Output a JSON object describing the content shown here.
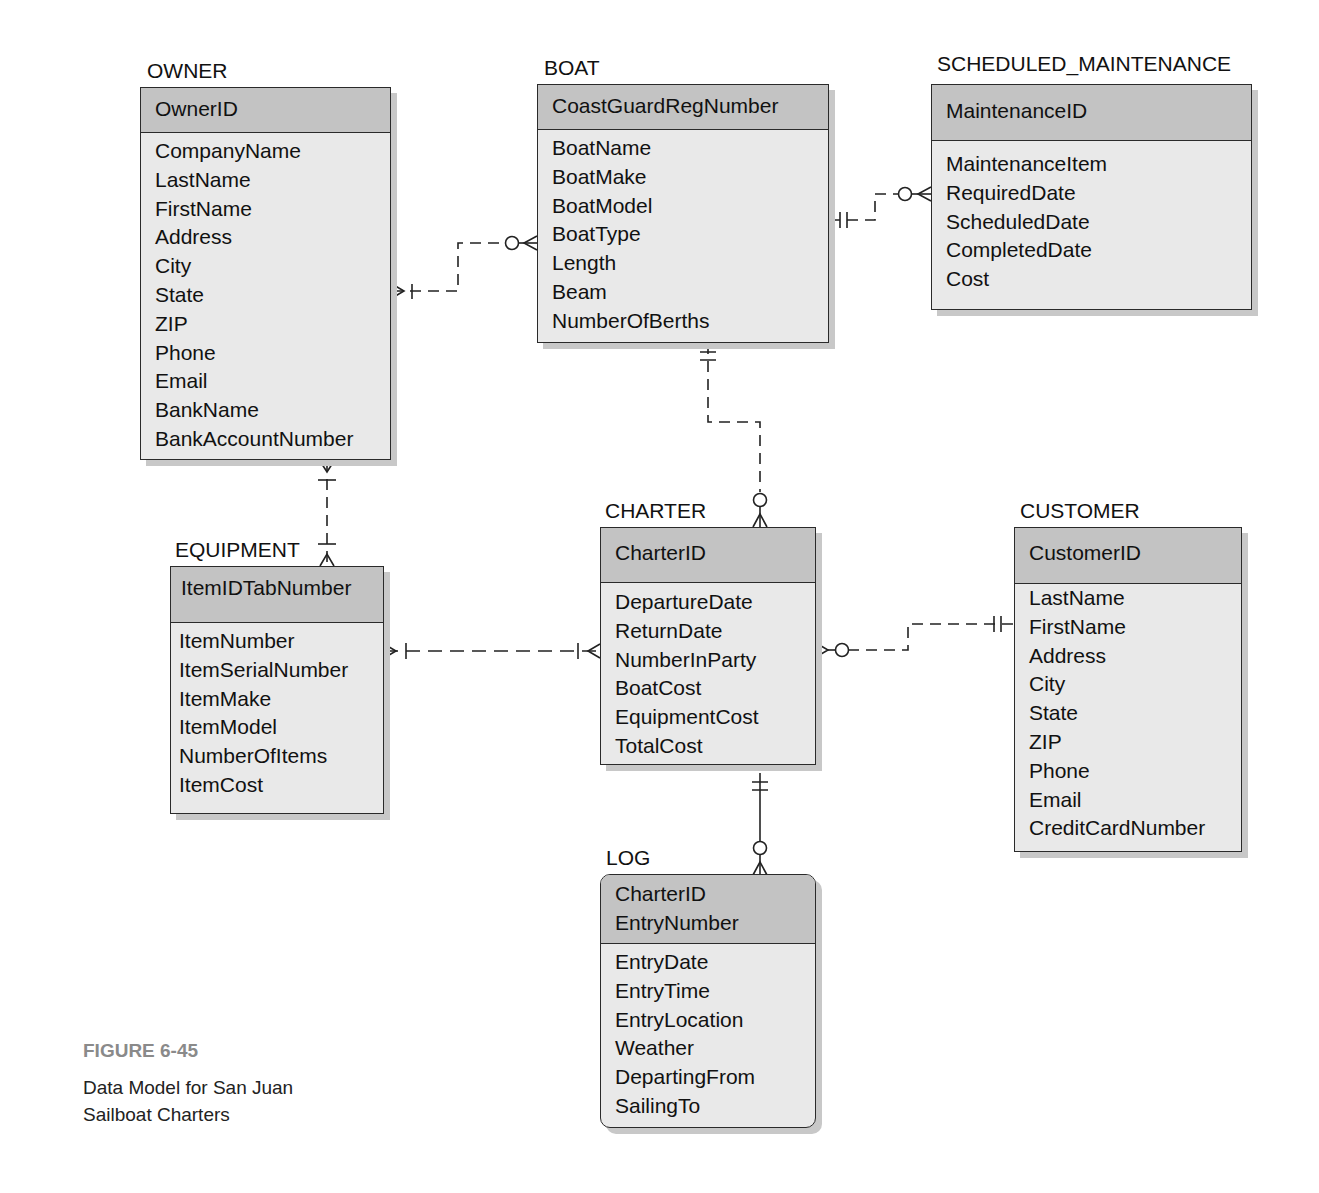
{
  "entities": {
    "owner": {
      "name": "OWNER",
      "keys": [
        "OwnerID"
      ],
      "attributes": [
        "CompanyName",
        "LastName",
        "FirstName",
        "Address",
        "City",
        "State",
        "ZIP",
        "Phone",
        "Email",
        "BankName",
        "BankAccountNumber"
      ]
    },
    "boat": {
      "name": "BOAT",
      "keys": [
        "CoastGuardRegNumber"
      ],
      "attributes": [
        "BoatName",
        "BoatMake",
        "BoatModel",
        "BoatType",
        "Length",
        "Beam",
        "NumberOfBerths"
      ]
    },
    "scheduled_maintenance": {
      "name": "SCHEDULED_MAINTENANCE",
      "keys": [
        "MaintenanceID"
      ],
      "attributes": [
        "MaintenanceItem",
        "RequiredDate",
        "ScheduledDate",
        "CompletedDate",
        "Cost"
      ]
    },
    "equipment": {
      "name": "EQUIPMENT",
      "keys": [
        "ItemIDTabNumber"
      ],
      "attributes": [
        "ItemNumber",
        "ItemSerialNumber",
        "ItemMake",
        "ItemModel",
        "NumberOfItems",
        "ItemCost"
      ]
    },
    "charter": {
      "name": "CHARTER",
      "keys": [
        "CharterID"
      ],
      "attributes": [
        "DepartureDate",
        "ReturnDate",
        "NumberInParty",
        "BoatCost",
        "EquipmentCost",
        "TotalCost"
      ]
    },
    "customer": {
      "name": "CUSTOMER",
      "keys": [
        "CustomerID"
      ],
      "attributes": [
        "LastName",
        "FirstName",
        "Address",
        "City",
        "State",
        "ZIP",
        "Phone",
        "Email",
        "CreditCardNumber"
      ]
    },
    "log": {
      "name": "LOG",
      "keys": [
        "CharterID",
        "EntryNumber"
      ],
      "attributes": [
        "EntryDate",
        "EntryTime",
        "EntryLocation",
        "Weather",
        "DepartingFrom",
        "SailingTo"
      ]
    }
  },
  "relationships": [
    {
      "from": "OWNER",
      "to": "BOAT",
      "from_end": "one-or-many",
      "to_end": "zero-or-many",
      "line": "dashed"
    },
    {
      "from": "BOAT",
      "to": "SCHEDULED_MAINTENANCE",
      "from_end": "exactly-one",
      "to_end": "zero-or-many",
      "line": "dashed"
    },
    {
      "from": "BOAT",
      "to": "CHARTER",
      "from_end": "exactly-one",
      "to_end": "zero-or-many",
      "line": "dashed"
    },
    {
      "from": "OWNER",
      "to": "EQUIPMENT",
      "from_end": "one-or-many",
      "to_end": "one-or-many",
      "line": "dashed"
    },
    {
      "from": "EQUIPMENT",
      "to": "CHARTER",
      "from_end": "one-or-many",
      "to_end": "one-or-many",
      "line": "dashed"
    },
    {
      "from": "CUSTOMER",
      "to": "CHARTER",
      "from_end": "exactly-one",
      "to_end": "zero-or-many",
      "line": "dashed"
    },
    {
      "from": "CHARTER",
      "to": "LOG",
      "from_end": "exactly-one",
      "to_end": "zero-or-many",
      "line": "solid"
    }
  ],
  "caption": {
    "figure": "FIGURE 6-45",
    "line1": "Data Model for San Juan",
    "line2": "Sailboat Charters"
  }
}
